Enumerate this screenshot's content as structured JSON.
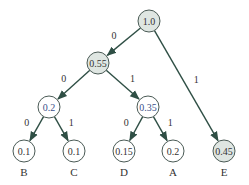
{
  "colors": {
    "edge": "#2f4f45",
    "shaded_fill": "#dfe6e2",
    "plain_fill": "#ffffff",
    "node_stroke": "#4a5a55"
  },
  "nodes": [
    {
      "id": "root",
      "value": "1.0",
      "x": 149,
      "y": 21,
      "shaded": true,
      "r": 11
    },
    {
      "id": "n055",
      "value": "0.55",
      "x": 98,
      "y": 63,
      "shaded": true,
      "r": 11
    },
    {
      "id": "n02i",
      "value": "0.2",
      "x": 49,
      "y": 107,
      "shaded": false,
      "internal": true,
      "r": 11
    },
    {
      "id": "n035",
      "value": "0.35",
      "x": 148,
      "y": 107,
      "shaded": false,
      "internal": true,
      "r": 11
    },
    {
      "id": "B",
      "value": "0.1",
      "x": 24,
      "y": 151,
      "shaded": false,
      "r": 11,
      "label": "B"
    },
    {
      "id": "C",
      "value": "0.1",
      "x": 74,
      "y": 151,
      "shaded": false,
      "r": 11,
      "label": "C"
    },
    {
      "id": "D",
      "value": "0.15",
      "x": 124,
      "y": 151,
      "shaded": false,
      "r": 11,
      "label": "D"
    },
    {
      "id": "A",
      "value": "0.2",
      "x": 173,
      "y": 151,
      "shaded": false,
      "r": 11,
      "label": "A"
    },
    {
      "id": "E",
      "value": "0.45",
      "x": 224,
      "y": 151,
      "shaded": true,
      "r": 11,
      "label": "E"
    }
  ],
  "edges": [
    {
      "from": "root",
      "to": "n055",
      "bit": "0"
    },
    {
      "from": "root",
      "to": "E",
      "bit": "1"
    },
    {
      "from": "n055",
      "to": "n02i",
      "bit": "0"
    },
    {
      "from": "n055",
      "to": "n035",
      "bit": "1"
    },
    {
      "from": "n02i",
      "to": "B",
      "bit": "0"
    },
    {
      "from": "n02i",
      "to": "C",
      "bit": "1"
    },
    {
      "from": "n035",
      "to": "D",
      "bit": "0"
    },
    {
      "from": "n035",
      "to": "A",
      "bit": "1"
    }
  ]
}
